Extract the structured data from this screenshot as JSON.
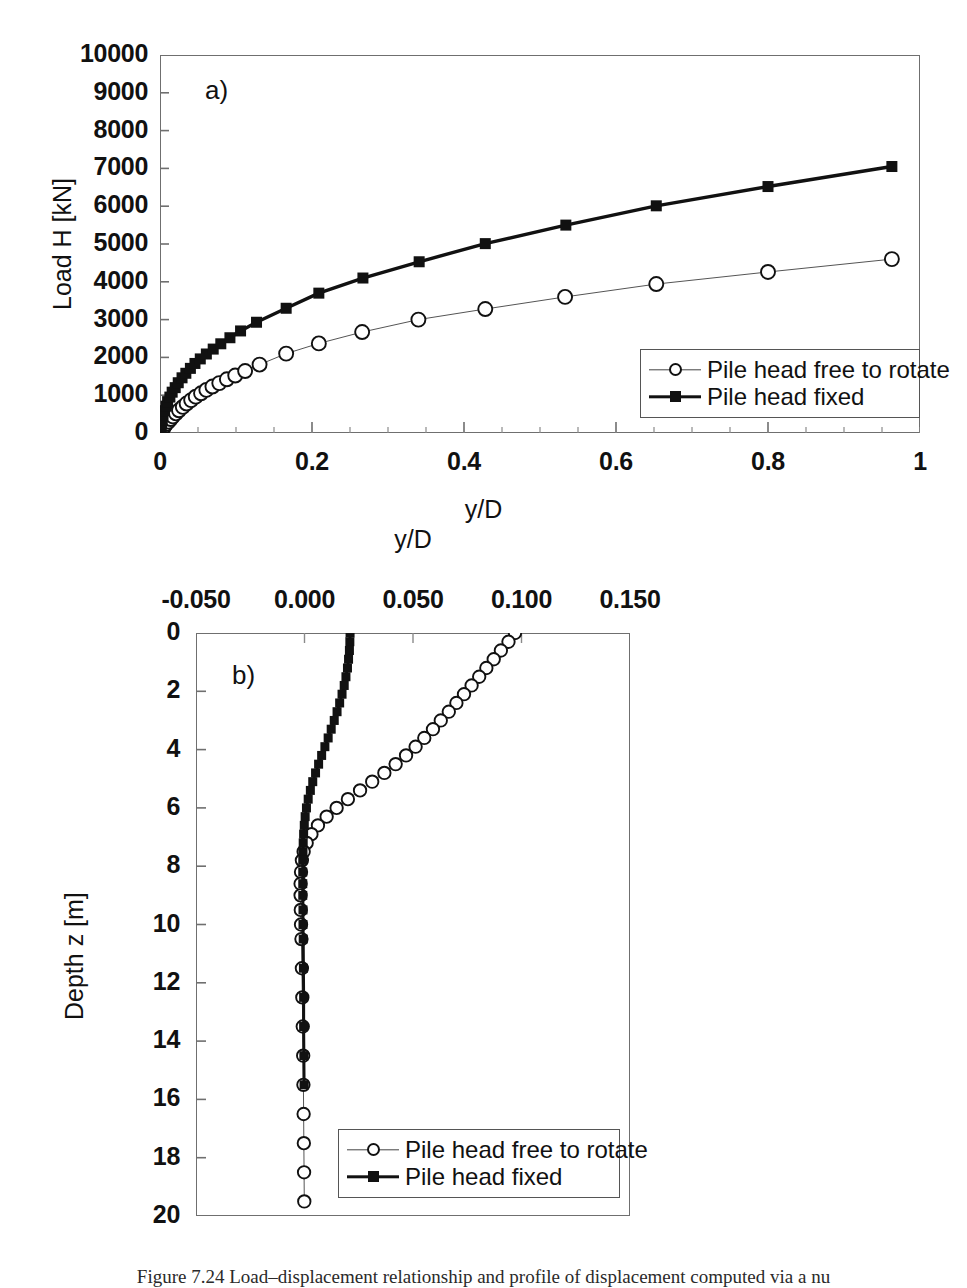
{
  "figure": {
    "caption_prefix": "Figure 7.24",
    "caption_text": "Figure 7.24 Load–displacement relationship and profile of displacement computed via a nu"
  },
  "panel_a": {
    "label": "a)",
    "y_axis_title": "Load H [kN]",
    "x_axis_title": "y/D",
    "y_ticks": [
      "0",
      "1000",
      "2000",
      "3000",
      "4000",
      "5000",
      "6000",
      "7000",
      "8000",
      "9000",
      "10000"
    ],
    "x_ticks": [
      "0",
      "0.2",
      "0.4",
      "0.6",
      "0.8",
      "1"
    ],
    "legend": [
      {
        "label": "Pile head free to rotate",
        "marker": "open-circle",
        "line": "thin"
      },
      {
        "label": "Pile head fixed",
        "marker": "filled-square",
        "line": "thick"
      }
    ]
  },
  "panel_b": {
    "label": "b)",
    "y_axis_title": "Depth z [m]",
    "x_axis_title": "y/D",
    "x_ticks": [
      "-0.050",
      "0.000",
      "0.050",
      "0.100",
      "0.150"
    ],
    "y_ticks": [
      "0",
      "2",
      "4",
      "6",
      "8",
      "10",
      "12",
      "14",
      "16",
      "18",
      "20"
    ],
    "legend": [
      {
        "label": "Pile head free to rotate",
        "marker": "open-circle",
        "line": "thin"
      },
      {
        "label": "Pile head fixed",
        "marker": "filled-square",
        "line": "thick"
      }
    ]
  },
  "colors": {
    "ink": "#111111",
    "frame": "#6f6f6f",
    "background": "#ffffff"
  },
  "chart_data": [
    {
      "type": "line",
      "id": "panel-a-load-displacement",
      "title": "a)",
      "xlabel": "y/D",
      "ylabel": "Load H [kN]",
      "xlim": [
        0,
        1
      ],
      "ylim": [
        0,
        10000
      ],
      "xticks": [
        0,
        0.2,
        0.4,
        0.6,
        0.8,
        1
      ],
      "yticks": [
        0,
        1000,
        2000,
        3000,
        4000,
        5000,
        6000,
        7000,
        8000,
        9000,
        10000
      ],
      "grid": false,
      "legend_position": "lower-right",
      "series": [
        {
          "name": "Pile head free to rotate",
          "marker": "open-circle",
          "line": "thin",
          "points": [
            [
              0.0,
              0
            ],
            [
              0.002,
              60
            ],
            [
              0.004,
              120
            ],
            [
              0.006,
              180
            ],
            [
              0.008,
              240
            ],
            [
              0.011,
              300
            ],
            [
              0.014,
              370
            ],
            [
              0.017,
              440
            ],
            [
              0.021,
              520
            ],
            [
              0.025,
              600
            ],
            [
              0.03,
              690
            ],
            [
              0.035,
              780
            ],
            [
              0.041,
              870
            ],
            [
              0.047,
              960
            ],
            [
              0.054,
              1050
            ],
            [
              0.061,
              1140
            ],
            [
              0.069,
              1230
            ],
            [
              0.078,
              1320
            ],
            [
              0.088,
              1420
            ],
            [
              0.099,
              1520
            ],
            [
              0.112,
              1640
            ],
            [
              0.131,
              1810
            ],
            [
              0.166,
              2100
            ],
            [
              0.209,
              2370
            ],
            [
              0.266,
              2670
            ],
            [
              0.34,
              3000
            ],
            [
              0.428,
              3280
            ],
            [
              0.533,
              3600
            ],
            [
              0.653,
              3940
            ],
            [
              0.8,
              4260
            ],
            [
              0.963,
              4600
            ]
          ]
        },
        {
          "name": "Pile head fixed",
          "marker": "filled-square",
          "line": "thick",
          "points": [
            [
              0.0,
              0
            ],
            [
              0.001,
              110
            ],
            [
              0.002,
              230
            ],
            [
              0.003,
              350
            ],
            [
              0.004,
              470
            ],
            [
              0.006,
              590
            ],
            [
              0.008,
              710
            ],
            [
              0.01,
              830
            ],
            [
              0.013,
              950
            ],
            [
              0.016,
              1080
            ],
            [
              0.02,
              1200
            ],
            [
              0.024,
              1330
            ],
            [
              0.029,
              1460
            ],
            [
              0.034,
              1580
            ],
            [
              0.04,
              1710
            ],
            [
              0.046,
              1840
            ],
            [
              0.053,
              1960
            ],
            [
              0.061,
              2090
            ],
            [
              0.07,
              2220
            ],
            [
              0.08,
              2360
            ],
            [
              0.092,
              2520
            ],
            [
              0.106,
              2700
            ],
            [
              0.127,
              2930
            ],
            [
              0.166,
              3300
            ],
            [
              0.209,
              3700
            ],
            [
              0.267,
              4100
            ],
            [
              0.341,
              4530
            ],
            [
              0.428,
              5010
            ],
            [
              0.534,
              5500
            ],
            [
              0.653,
              6010
            ],
            [
              0.8,
              6520
            ],
            [
              0.963,
              7050
            ]
          ]
        }
      ]
    },
    {
      "type": "line",
      "id": "panel-b-displacement-profile",
      "title": "b)",
      "xlabel": "y/D",
      "ylabel": "Depth z [m]",
      "xlim": [
        -0.05,
        0.15
      ],
      "ylim": [
        20,
        0
      ],
      "xticks": [
        -0.05,
        0.0,
        0.05,
        0.1,
        0.15
      ],
      "yticks": [
        0,
        2,
        4,
        6,
        8,
        10,
        12,
        14,
        16,
        18,
        20
      ],
      "x_axis_position": "top",
      "y_axis_direction": "down",
      "grid": false,
      "legend_position": "lower-right",
      "series": [
        {
          "name": "Pile head free to rotate",
          "marker": "open-circle",
          "line": "thin",
          "points": [
            [
              0.097,
              0.0
            ],
            [
              0.094,
              0.3
            ],
            [
              0.0905,
              0.6
            ],
            [
              0.0872,
              0.9
            ],
            [
              0.0838,
              1.2
            ],
            [
              0.0805,
              1.5
            ],
            [
              0.077,
              1.8
            ],
            [
              0.0735,
              2.1
            ],
            [
              0.07,
              2.4
            ],
            [
              0.0665,
              2.7
            ],
            [
              0.0628,
              3.0
            ],
            [
              0.0592,
              3.3
            ],
            [
              0.0552,
              3.6
            ],
            [
              0.0512,
              3.9
            ],
            [
              0.0468,
              4.2
            ],
            [
              0.042,
              4.5
            ],
            [
              0.0368,
              4.8
            ],
            [
              0.0312,
              5.1
            ],
            [
              0.0256,
              5.4
            ],
            [
              0.02,
              5.7
            ],
            [
              0.0148,
              6.0
            ],
            [
              0.0102,
              6.3
            ],
            [
              0.0062,
              6.6
            ],
            [
              0.0032,
              6.9
            ],
            [
              0.001,
              7.2
            ],
            [
              -0.0004,
              7.5
            ],
            [
              -0.0012,
              7.8
            ],
            [
              -0.0016,
              8.2
            ],
            [
              -0.0018,
              8.6
            ],
            [
              -0.0018,
              9.0
            ],
            [
              -0.0017,
              9.5
            ],
            [
              -0.0016,
              10.0
            ],
            [
              -0.0014,
              10.5
            ],
            [
              -0.0012,
              11.5
            ],
            [
              -0.001,
              12.5
            ],
            [
              -0.0008,
              13.5
            ],
            [
              -0.0006,
              14.5
            ],
            [
              -0.0005,
              15.5
            ],
            [
              -0.0004,
              16.5
            ],
            [
              -0.0003,
              17.5
            ],
            [
              -0.0002,
              18.5
            ],
            [
              -0.0001,
              19.5
            ]
          ]
        },
        {
          "name": "Pile head fixed",
          "marker": "filled-square",
          "line": "thick",
          "points": [
            [
              0.021,
              0.0
            ],
            [
              0.0209,
              0.3
            ],
            [
              0.0207,
              0.6
            ],
            [
              0.0203,
              0.9
            ],
            [
              0.0198,
              1.2
            ],
            [
              0.0191,
              1.5
            ],
            [
              0.0183,
              1.8
            ],
            [
              0.0173,
              2.1
            ],
            [
              0.0162,
              2.4
            ],
            [
              0.015,
              2.7
            ],
            [
              0.0137,
              3.0
            ],
            [
              0.0123,
              3.3
            ],
            [
              0.0109,
              3.6
            ],
            [
              0.0094,
              3.9
            ],
            [
              0.0079,
              4.2
            ],
            [
              0.0065,
              4.5
            ],
            [
              0.0051,
              4.8
            ],
            [
              0.0038,
              5.1
            ],
            [
              0.0027,
              5.4
            ],
            [
              0.0017,
              5.7
            ],
            [
              0.0009,
              6.0
            ],
            [
              0.0003,
              6.3
            ],
            [
              -0.0001,
              6.6
            ],
            [
              -0.0004,
              6.9
            ],
            [
              -0.0006,
              7.2
            ],
            [
              -0.0007,
              7.5
            ],
            [
              -0.0008,
              7.8
            ],
            [
              -0.0008,
              8.2
            ],
            [
              -0.0008,
              8.6
            ],
            [
              -0.0008,
              9.0
            ],
            [
              -0.0007,
              9.5
            ],
            [
              -0.0007,
              10.0
            ],
            [
              -0.0006,
              10.5
            ],
            [
              -0.0005,
              11.5
            ],
            [
              -0.0004,
              12.5
            ],
            [
              -0.0004,
              13.5
            ],
            [
              -0.0003,
              14.5
            ],
            [
              -0.0002,
              15.5
            ]
          ]
        }
      ]
    }
  ]
}
